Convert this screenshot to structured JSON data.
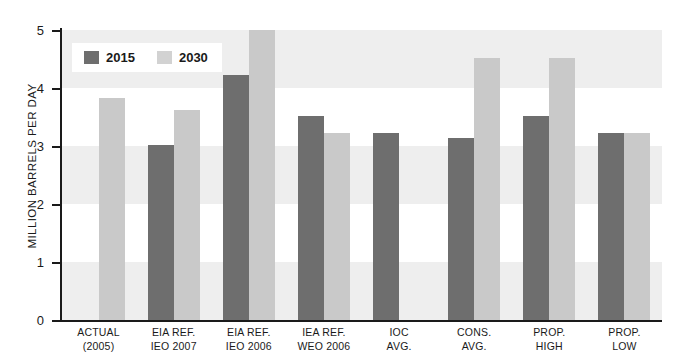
{
  "chart_data": {
    "type": "bar",
    "title": "",
    "xlabel": "",
    "ylabel": "MILLION BARRELS PER DAY",
    "ylim": [
      0,
      5
    ],
    "yticks": [
      0,
      1,
      2,
      3,
      4,
      5
    ],
    "ytick_labels": [
      "0",
      "1",
      "2",
      "3",
      "4",
      "5"
    ],
    "grid": false,
    "banding": "alternating horizontal light-gray bands between gridlines",
    "legend_position": "top-left inside plot",
    "categories": [
      "ACTUAL (2005)",
      "EIA REF. IEO 2007",
      "EIA REF. IEO 2006",
      "IEA REF. WEO 2006",
      "IOC AVG.",
      "CONS. AVG.",
      "PROP. HIGH",
      "PROP. LOW"
    ],
    "category_lines": [
      [
        "ACTUAL",
        "(2005)"
      ],
      [
        "EIA REF.",
        "IEO 2007"
      ],
      [
        "EIA REF.",
        "IEO 2006"
      ],
      [
        "IEA REF.",
        "WEO 2006"
      ],
      [
        "IOC",
        "AVG."
      ],
      [
        "CONS.",
        "AVG."
      ],
      [
        "PROP.",
        "HIGH"
      ],
      [
        "PROP.",
        "LOW"
      ]
    ],
    "series": [
      {
        "name": "2015",
        "color": "#6e6e6e",
        "values": [
          null,
          3.02,
          4.22,
          3.52,
          3.22,
          3.14,
          3.52,
          3.22
        ]
      },
      {
        "name": "2030",
        "color": "#c9c9c9",
        "values": [
          3.82,
          3.62,
          5.0,
          3.22,
          null,
          4.52,
          4.52,
          3.22
        ]
      }
    ]
  },
  "legend": {
    "entries": [
      {
        "label": "2015",
        "color": "#6e6e6e"
      },
      {
        "label": "2030",
        "color": "#d2d2d2"
      }
    ]
  }
}
